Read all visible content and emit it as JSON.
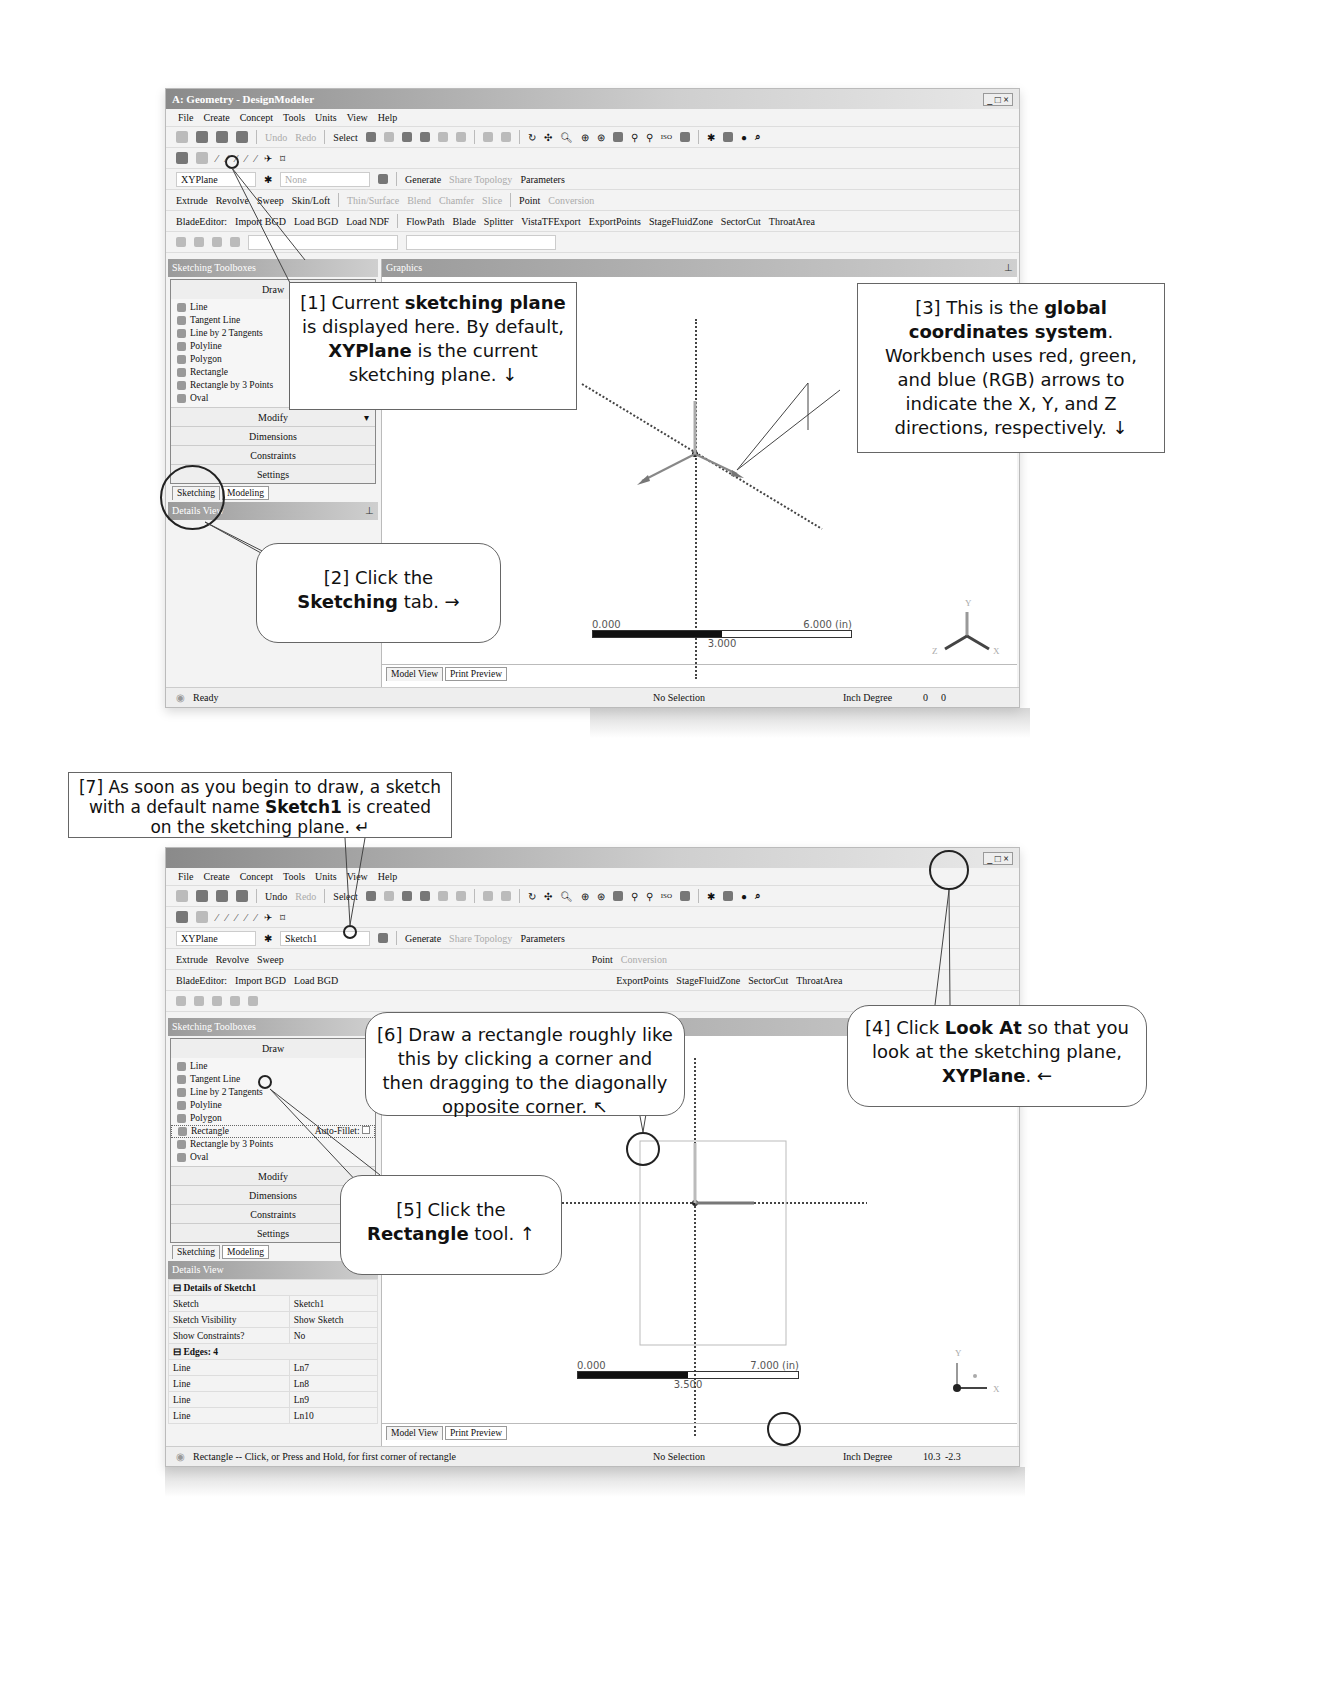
{
  "window1": {
    "title": "A: Geometry - DesignModeler",
    "window_controls": "_ □ ×",
    "menu": [
      "File",
      "Create",
      "Concept",
      "Tools",
      "Units",
      "View",
      "Help"
    ],
    "toolbar1": {
      "undo": "Undo",
      "redo": "Redo",
      "select": "Select"
    },
    "plane_combo": "XYPlane",
    "sketch_combo": "None",
    "generate": "Generate",
    "share_topology": "Share Topology",
    "parameters": "Parameters",
    "features": [
      "Extrude",
      "Revolve",
      "Sweep",
      "Skin/Loft"
    ],
    "features_disabled": [
      "Thin/Surface",
      "Blend",
      "Chamfer",
      "Slice"
    ],
    "point": "Point",
    "conversion": "Conversion",
    "blade_editor": [
      "BladeEditor:",
      "Import BGD",
      "Load BGD",
      "Load NDF",
      "FlowPath",
      "Blade",
      "Splitter",
      "VistaTFExport",
      "ExportPoints",
      "StageFluidZone",
      "SectorCut",
      "ThroatArea"
    ],
    "toolbox_header": "Sketching Toolboxes",
    "graphics_header": "Graphics",
    "draw_section": "Draw",
    "draw_tools": [
      "Line",
      "Tangent Line",
      "Line by 2 Tangents",
      "Polyline",
      "Polygon",
      "Rectangle",
      "Rectangle by 3 Points",
      "Oval"
    ],
    "sections": [
      "Modify",
      "Dimensions",
      "Constraints",
      "Settings"
    ],
    "tabs": [
      "Sketching",
      "Modeling"
    ],
    "details_header": "Details View",
    "view_tabs": [
      "Model View",
      "Print Preview"
    ],
    "scale": {
      "left": "0.000",
      "right": "6.000 (in)",
      "mid": "3.000"
    },
    "triad": {
      "x": "X",
      "y": "Y",
      "z": "Z"
    },
    "status": {
      "message": "Ready",
      "selection": "No Selection",
      "units": "Inch  Degree",
      "coords": [
        "0",
        "0"
      ]
    }
  },
  "window2": {
    "window_controls": "_ □ ×",
    "menu": [
      "File",
      "Create",
      "Concept",
      "Tools",
      "Units",
      "View",
      "Help"
    ],
    "toolbar1": {
      "undo": "Undo",
      "redo": "Redo",
      "select": "Select"
    },
    "plane_combo": "XYPlane",
    "sketch_combo": "Sketch1",
    "generate": "Generate",
    "share_topology": "Share Topology",
    "parameters": "Parameters",
    "features": [
      "Extrude",
      "Revolve",
      "Sweep"
    ],
    "point": "Point",
    "conversion": "Conversion",
    "blade_editor": [
      "BladeEditor:",
      "Import BGD",
      "Load BGD",
      "ExportPoints",
      "StageFluidZone",
      "SectorCut",
      "ThroatArea"
    ],
    "toolbox_header": "Sketching Toolboxes",
    "draw_section": "Draw",
    "draw_tools": [
      "Line",
      "Tangent Line",
      "Line by 2 Tangents",
      "Polyline",
      "Polygon",
      "Rectangle",
      "Rectangle by 3 Points",
      "Oval"
    ],
    "auto_fillet": "Auto-Fillet:",
    "sections": [
      "Modify",
      "Dimensions",
      "Constraints",
      "Settings"
    ],
    "tabs": [
      "Sketching",
      "Modeling"
    ],
    "details_header": "Details View",
    "details": {
      "group1": "Details of Sketch1",
      "rows1": [
        [
          "Sketch",
          "Sketch1"
        ],
        [
          "Sketch Visibility",
          "Show Sketch"
        ],
        [
          "Show Constraints?",
          "No"
        ]
      ],
      "group2": "Edges: 4",
      "rows2": [
        [
          "Line",
          "Ln7"
        ],
        [
          "Line",
          "Ln8"
        ],
        [
          "Line",
          "Ln9"
        ],
        [
          "Line",
          "Ln10"
        ]
      ]
    },
    "view_tabs": [
      "Model View",
      "Print Preview"
    ],
    "scale": {
      "left": "0.000",
      "right": "7.000 (in)",
      "mid": "3.500"
    },
    "triad": {
      "x": "X",
      "y": "Y",
      "z": "Z"
    },
    "status": {
      "message": "Rectangle -- Click, or Press and Hold, for first corner of rectangle",
      "selection": "No Selection",
      "units": "Inch  Degree",
      "coords": [
        "10.3",
        "-2.3"
      ]
    }
  },
  "callouts": {
    "c1": {
      "pre": "[1] Current ",
      "b1": "sketching plane",
      "mid": " is displayed here.  By default, ",
      "b2": "XYPlane",
      "post": " is the current sketching plane. ↓"
    },
    "c2": {
      "pre": "[2] Click the ",
      "b1": "Sketching",
      "post": " tab. →"
    },
    "c3": {
      "pre": "[3] This is the ",
      "b1": "global coordinates system",
      "post": ". Workbench uses red, green, and blue (RGB) arrows to indicate the X, Y, and Z directions, respectively. ↓"
    },
    "c4": {
      "pre": "[4] Click ",
      "b1": "Look At",
      "mid": " so that you look at the sketching plane, ",
      "b2": "XYPlane",
      "post": ". ←"
    },
    "c5": {
      "pre": "[5] Click the ",
      "b1": "Rectangle",
      "post": " tool. ↑"
    },
    "c6": {
      "text": "[6] Draw a rectangle roughly like this by clicking a corner and then dragging to the diagonally opposite corner. ↖"
    },
    "c7": {
      "pre": "[7] As soon as you begin to draw, a sketch with a default name ",
      "b1": "Sketch1",
      "post": " is created on the sketching plane. ↵"
    }
  }
}
